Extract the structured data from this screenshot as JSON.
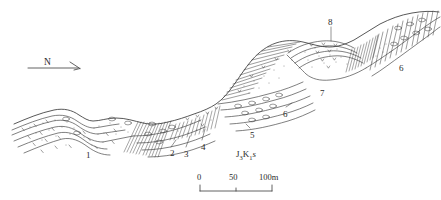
{
  "figure": {
    "kind": "geological-cross-section",
    "line_color": "#3a3a3a",
    "background": "#ffffff"
  },
  "compass": {
    "label": "N",
    "direction": "east-pointing-arrow"
  },
  "strat_label": {
    "unit": "J",
    "unit_sub": "3",
    "unit2": "K",
    "unit2_sub": "1",
    "member": "s"
  },
  "unit_labels": [
    {
      "id": "u1",
      "text": "1",
      "x": 86,
      "y": 151
    },
    {
      "id": "u2",
      "text": "2",
      "x": 170,
      "y": 149
    },
    {
      "id": "u3",
      "text": "3",
      "x": 184,
      "y": 150
    },
    {
      "id": "u4",
      "text": "4",
      "x": 201,
      "y": 143
    },
    {
      "id": "u5",
      "text": "5",
      "x": 250,
      "y": 131
    },
    {
      "id": "u6a",
      "text": "6",
      "x": 283,
      "y": 110
    },
    {
      "id": "u7",
      "text": "7",
      "x": 320,
      "y": 89
    },
    {
      "id": "u8",
      "text": "8",
      "x": 331,
      "y": 22
    },
    {
      "id": "u6b",
      "text": "6",
      "x": 399,
      "y": 64
    }
  ],
  "scalebar": {
    "ticks": [
      {
        "value": "0",
        "x": 200
      },
      {
        "value": "50",
        "x": 232
      },
      {
        "value": "100m",
        "x": 266
      }
    ],
    "x_start": 200,
    "x_end": 272,
    "y_axis": 189
  }
}
